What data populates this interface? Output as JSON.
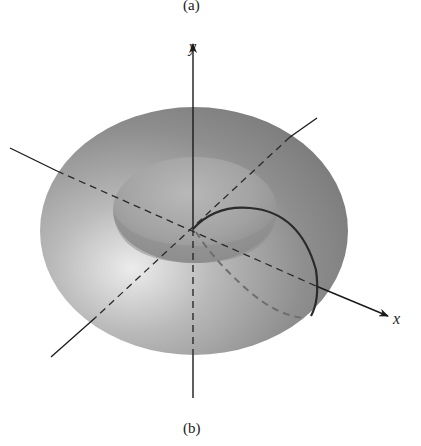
{
  "figure": {
    "caption_top": "(a)",
    "caption_bottom": "(b)",
    "axes": {
      "y_label": "y",
      "x_label": "x",
      "origin": [
        193,
        229
      ]
    },
    "surface": {
      "type": "torus",
      "outer_fill": "#8f8f8f",
      "highlight_fill": "#e6e6e6",
      "inner_fill": "#a8a8a8"
    },
    "curve": {
      "description": "dark solid arc from origin over torus surface to x-axis",
      "color": "#2a2a2a",
      "hidden_part_color": "#6e6e6e"
    }
  }
}
